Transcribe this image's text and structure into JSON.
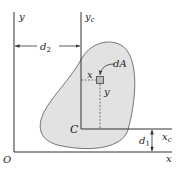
{
  "diagram": {
    "type": "parallel-axis-theorem",
    "labels": {
      "origin": "O",
      "x_axis": "x",
      "y_axis": "y",
      "xc_axis_main": "x",
      "xc_axis_sub": "c",
      "yc_axis_main": "y",
      "yc_axis_sub": "c",
      "centroid": "C",
      "area_element": "dA",
      "local_x": "x",
      "local_y": "y",
      "d1_main": "d",
      "d1_sub": "1",
      "d2_main": "d",
      "d2_sub": "2"
    },
    "colors": {
      "region_fill": "#e2e2e2",
      "line": "#333333",
      "text": "#222222"
    }
  }
}
